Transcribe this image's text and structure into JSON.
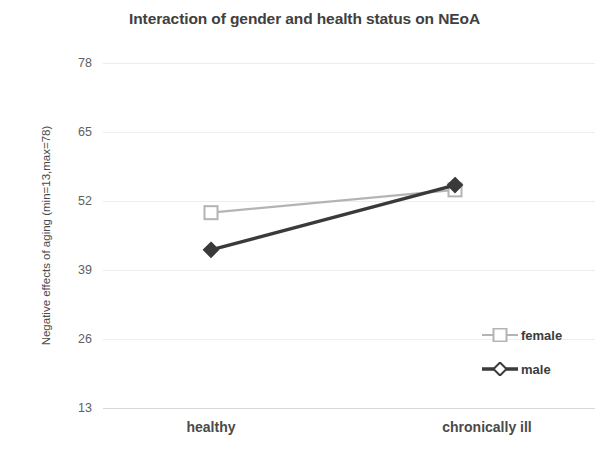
{
  "chart_data": {
    "type": "line",
    "title": "Interaction of gender and health status on NEoA",
    "xlabel": "",
    "ylabel": "Negative effects of aging (min=13,max=78)",
    "categories": [
      "healthy",
      "chronically ill"
    ],
    "yticks": [
      78,
      65,
      52,
      39,
      26,
      13
    ],
    "ylim": [
      13,
      78
    ],
    "grid": true,
    "legend_position": "inside-bottom-right",
    "series": [
      {
        "name": "female",
        "values": [
          49.8,
          54.1
        ],
        "color": "#b4b4b4",
        "marker": "square"
      },
      {
        "name": "male",
        "values": [
          42.8,
          55.0
        ],
        "color": "#3a3a3a",
        "marker": "diamond"
      }
    ]
  },
  "colors": {
    "female": "#b4b4b4",
    "male": "#3a3a3a",
    "grid": "#ededed",
    "axis": "#d8d8d8",
    "title_text": "#404040",
    "tick_text": "#606060"
  }
}
